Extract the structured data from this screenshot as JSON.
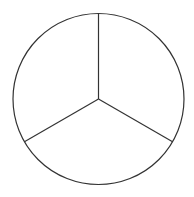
{
  "diagram": {
    "type": "circle-divided-into-sectors",
    "background": "#ffffff",
    "stroke_color": "#333333",
    "stroke_width": 1.2,
    "center": {
      "x": 98.5,
      "y": 99
    },
    "radius": 85.5,
    "sector_count": 3,
    "spoke_angles_deg": [
      90,
      210,
      330
    ],
    "sectors": [
      {
        "label": "",
        "from_deg": 90,
        "to_deg": 210
      },
      {
        "label": "",
        "from_deg": 210,
        "to_deg": 330
      },
      {
        "label": "",
        "from_deg": 330,
        "to_deg": 450
      }
    ]
  }
}
